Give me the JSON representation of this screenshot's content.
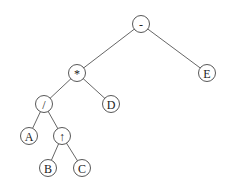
{
  "diagram": {
    "type": "expression-tree",
    "nodes": [
      {
        "id": "minus",
        "label": "-",
        "x": 141,
        "y": 24
      },
      {
        "id": "times",
        "label": "*",
        "x": 77,
        "y": 73
      },
      {
        "id": "E",
        "label": "E",
        "x": 207,
        "y": 73
      },
      {
        "id": "divide",
        "label": "/",
        "x": 44,
        "y": 104
      },
      {
        "id": "D",
        "label": "D",
        "x": 111,
        "y": 104
      },
      {
        "id": "A",
        "label": "A",
        "x": 29,
        "y": 136
      },
      {
        "id": "power",
        "label": "↑",
        "x": 62,
        "y": 136
      },
      {
        "id": "B",
        "label": "B",
        "x": 48,
        "y": 168
      },
      {
        "id": "C",
        "label": "C",
        "x": 82,
        "y": 168
      }
    ],
    "edges": [
      {
        "from": "minus",
        "to": "times"
      },
      {
        "from": "minus",
        "to": "E"
      },
      {
        "from": "times",
        "to": "divide"
      },
      {
        "from": "times",
        "to": "D"
      },
      {
        "from": "divide",
        "to": "A"
      },
      {
        "from": "divide",
        "to": "power"
      },
      {
        "from": "power",
        "to": "B"
      },
      {
        "from": "power",
        "to": "C"
      }
    ],
    "node_radius": 8.5,
    "colors": {
      "stroke": "#444444",
      "edge": "#555555",
      "text": "#222222",
      "background": "#ffffff"
    }
  }
}
